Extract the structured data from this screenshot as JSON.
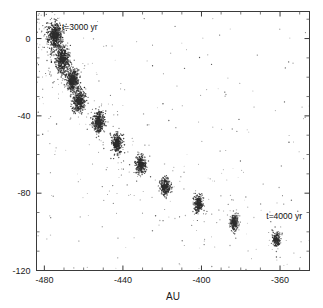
{
  "figure": {
    "background_color": "#ffffff",
    "frame_color": "#3a3a3a",
    "point_color": "#2b2b2b"
  },
  "axes": {
    "x_title": "AU",
    "y_title": "",
    "x_ticklabels": [
      "-480",
      "-440",
      "-400",
      "-360"
    ],
    "x_tickvalues": [
      -480,
      -440,
      -400,
      -360
    ],
    "y_ticklabels": [
      "0",
      "-40",
      "-80",
      "-120"
    ],
    "y_tickvalues": [
      0,
      -40,
      -80,
      -120
    ],
    "x_range": [
      -484,
      -345
    ],
    "y_range": [
      -120,
      14
    ],
    "x_minor_step": 10,
    "y_minor_step": 10,
    "grid": false
  },
  "annotations": [
    {
      "name": "t3000-label",
      "text": "t=3000 yr",
      "x": -471.0,
      "y": 4.5
    },
    {
      "name": "t4000-label",
      "text": "t=4000 yr",
      "x": -367.0,
      "y": -93.5
    }
  ],
  "chart_data": {
    "type": "scatter",
    "title": "",
    "xlabel": "AU",
    "ylabel": "",
    "xlim": [
      -484,
      -345
    ],
    "ylim": [
      -120,
      14
    ],
    "grid": false,
    "legend": "none",
    "series": [
      {
        "name": "clumps",
        "marker": "dense-cluster",
        "color": "#2b2b2b",
        "points": [
          {
            "label": "c1",
            "x": -474.5,
            "y": 1.5,
            "sigma": 3.2,
            "n": 520
          },
          {
            "label": "c2",
            "x": -470.8,
            "y": -10.8,
            "sigma": 3.0,
            "n": 470
          },
          {
            "label": "c3",
            "x": -465.6,
            "y": -21.5,
            "sigma": 2.7,
            "n": 430
          },
          {
            "label": "c4",
            "x": -462.3,
            "y": -32.3,
            "sigma": 2.5,
            "n": 400
          },
          {
            "label": "c5",
            "x": -452.4,
            "y": -43.2,
            "sigma": 2.4,
            "n": 380
          },
          {
            "label": "c6",
            "x": -443.0,
            "y": -54.5,
            "sigma": 2.2,
            "n": 340
          },
          {
            "label": "c7",
            "x": -430.8,
            "y": -65.3,
            "sigma": 2.1,
            "n": 310
          },
          {
            "label": "c8",
            "x": -418.5,
            "y": -76.6,
            "sigma": 2.0,
            "n": 280
          },
          {
            "label": "c9",
            "x": -401.5,
            "y": -85.3,
            "sigma": 1.9,
            "n": 250
          },
          {
            "label": "c10",
            "x": -383.2,
            "y": -95.0,
            "sigma": 1.8,
            "n": 220
          },
          {
            "label": "c11",
            "x": -362.0,
            "y": -104.0,
            "sigma": 1.7,
            "n": 190
          }
        ]
      },
      {
        "name": "diffuse-halo",
        "marker": "point",
        "color": "#2b2b2b",
        "n_points": 5200,
        "description": "Sparse scattered particles densest along the clump chain and the left edge, thinning toward the upper right."
      }
    ]
  }
}
